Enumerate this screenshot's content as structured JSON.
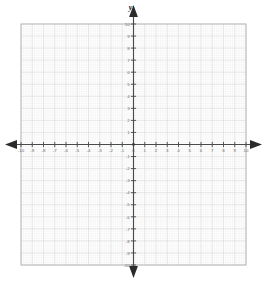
{
  "figure": {
    "kind": "cartesian-coordinate-grid",
    "background_color": "#ffffff",
    "axis_color": "#4a4a4a",
    "grid_major_color": "#dcdcdc",
    "grid_minor_color": "#f1f1f1",
    "border_color": "#b4b4b4",
    "label_color": "#6d6d6d",
    "y_axis_name": "y",
    "x_axis_name": ""
  },
  "chart_data": {
    "type": "scatter",
    "title": "",
    "xlabel": "",
    "ylabel": "y",
    "xlim": [
      -10,
      10
    ],
    "ylim": [
      -10,
      10
    ],
    "grid": true,
    "legend": "none",
    "x_major_step": 1,
    "y_major_step": 1,
    "minor_subdivisions": 5,
    "x_ticks": [
      -10,
      -9,
      -8,
      -7,
      -6,
      -5,
      -4,
      -3,
      -2,
      -1,
      0,
      1,
      2,
      3,
      4,
      5,
      6,
      7,
      8,
      9,
      10
    ],
    "y_ticks": [
      -10,
      -9,
      -8,
      -7,
      -6,
      -5,
      -4,
      -3,
      -2,
      -1,
      0,
      1,
      2,
      3,
      4,
      5,
      6,
      7,
      8,
      9,
      10
    ],
    "x_tick_labels": [
      "-10",
      "-9",
      "-8",
      "-7",
      "-6",
      "-5",
      "-4",
      "-3",
      "-2",
      "-1",
      "0",
      "1",
      "2",
      "3",
      "4",
      "5",
      "6",
      "7",
      "8",
      "9",
      "10"
    ],
    "y_tick_labels": [
      "-10",
      "-9",
      "-8",
      "-7",
      "-6",
      "-5",
      "-4",
      "-3",
      "-2",
      "-1",
      "0",
      "1",
      "2",
      "3",
      "4",
      "5",
      "6",
      "7",
      "8",
      "9",
      "10"
    ],
    "series": [],
    "annotations": [],
    "arrows": [
      "left",
      "right",
      "up",
      "down"
    ]
  },
  "geometry": {
    "plot_left": 21,
    "plot_top": 24,
    "plot_right": 246,
    "plot_bottom": 265,
    "origin_x": 133.5,
    "origin_y": 144.5,
    "unit_x": 11.25,
    "unit_y": 12.05
  }
}
